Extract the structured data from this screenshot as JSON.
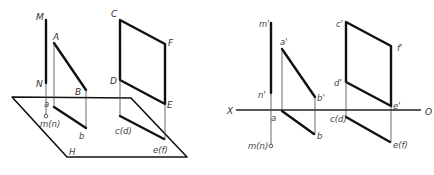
{
  "figure": {
    "left_view": {
      "title": "pictorial view (H plane)",
      "plane_label": "H",
      "labels": {
        "M": "M",
        "N": "N",
        "A": "A",
        "B": "B",
        "a": "a",
        "b": "b",
        "mn": "m(n)",
        "C": "C",
        "D": "D",
        "E": "E",
        "F": "F",
        "cd": "c(d)",
        "ef": "e(f)"
      }
    },
    "right_view": {
      "title": "orthographic projection",
      "axis_start_label": "X",
      "axis_end_label": "O",
      "labels": {
        "m_prime": "m'",
        "n_prime": "n'",
        "a_prime": "a'",
        "b_prime": "b'",
        "a": "a",
        "b": "b",
        "mn": "m(n)",
        "c_prime": "c'",
        "d_prime": "d'",
        "e_prime": "e'",
        "f_prime": "f'",
        "cd": "c(d)",
        "ef": "e(f)"
      }
    }
  }
}
